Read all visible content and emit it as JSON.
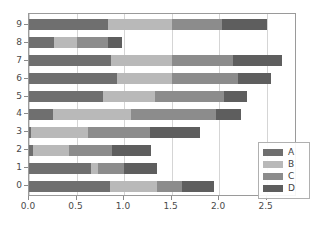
{
  "chart_data": {
    "type": "bar",
    "orientation": "horizontal",
    "stacked": true,
    "title": "",
    "xlabel": "",
    "ylabel": "",
    "xlim": [
      0.0,
      2.82
    ],
    "ylim": [
      -0.6,
      9.6
    ],
    "grid": true,
    "grid_axis": "x",
    "legend_position": "lower right",
    "categories": [
      "0",
      "1",
      "2",
      "3",
      "4",
      "5",
      "6",
      "7",
      "8",
      "9"
    ],
    "xticks": [
      0.0,
      0.5,
      1.0,
      1.5,
      2.0,
      2.5
    ],
    "xticklabels": [
      "0.0",
      "0.5",
      "1.0",
      "1.5",
      "2.0",
      "2.5"
    ],
    "yticks": [
      0,
      1,
      2,
      3,
      4,
      5,
      6,
      7,
      8,
      9
    ],
    "yticklabels": [
      "0",
      "1",
      "2",
      "3",
      "4",
      "5",
      "6",
      "7",
      "8",
      "9"
    ],
    "series": [
      {
        "name": "A",
        "color": "#6f6f6f",
        "values": [
          0.85,
          0.65,
          0.04,
          0.02,
          0.25,
          0.78,
          0.93,
          0.86,
          0.26,
          0.83
        ]
      },
      {
        "name": "B",
        "color": "#b9b9b9",
        "values": [
          0.5,
          0.08,
          0.38,
          0.6,
          0.82,
          0.55,
          0.57,
          0.64,
          0.24,
          0.67
        ]
      },
      {
        "name": "C",
        "color": "#8c8c8c",
        "values": [
          0.26,
          0.27,
          0.45,
          0.65,
          0.9,
          0.72,
          0.7,
          0.65,
          0.33,
          0.53
        ]
      },
      {
        "name": "D",
        "color": "#5e5e5e",
        "values": [
          0.34,
          0.35,
          0.41,
          0.53,
          0.26,
          0.24,
          0.35,
          0.51,
          0.15,
          0.47
        ]
      }
    ],
    "totals": [
      1.95,
      1.35,
      1.28,
      1.8,
      2.23,
      2.29,
      2.55,
      2.66,
      0.98,
      2.5
    ]
  },
  "legend": {
    "entries": [
      {
        "label": "A"
      },
      {
        "label": "B"
      },
      {
        "label": "C"
      },
      {
        "label": "D"
      }
    ]
  }
}
